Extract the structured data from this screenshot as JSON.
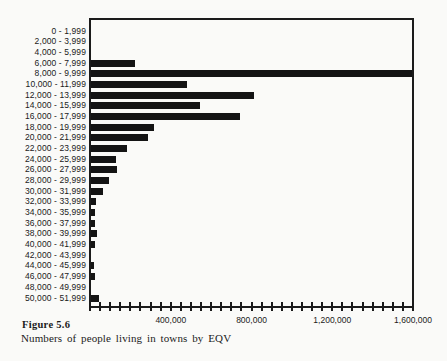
{
  "figure": {
    "label": "Figure 5.6",
    "caption": "Numbers of people living in towns by EQV"
  },
  "chart_data": {
    "type": "bar",
    "orientation": "horizontal",
    "title": "",
    "xlabel": "",
    "ylabel": "",
    "categories": [
      "0 - 1,999",
      "2,000 - 3,999",
      "4,000 - 5,999",
      "6,000 - 7,999",
      "8,000 - 9,999",
      "10,000 - 11,999",
      "12,000 - 13,999",
      "14,000 - 15,999",
      "16,000 - 17,999",
      "18,000 - 19,999",
      "20,000 - 21,999",
      "22,000 - 23,999",
      "24,000 - 25,999",
      "26,000 - 27,999",
      "28,000 - 29,999",
      "30,000 - 31,999",
      "32,000 - 33,999",
      "34,000 - 35,999",
      "36,000 - 37,999",
      "38,000 - 39,999",
      "40,000 - 41,999",
      "42,000 - 43,999",
      "44,000 - 45,999",
      "46,000 - 47,999",
      "48,000 - 49,999",
      "50,000 - 51,999"
    ],
    "values": [
      0,
      0,
      0,
      220000,
      1600000,
      480000,
      810000,
      545000,
      745000,
      315000,
      285000,
      180000,
      125000,
      130000,
      90000,
      60000,
      25000,
      20000,
      20000,
      30000,
      20000,
      0,
      15000,
      20000,
      0,
      40000
    ],
    "xlim": [
      0,
      1600000
    ],
    "x_tick_values": [
      400000,
      800000,
      1200000,
      1600000
    ],
    "x_tick_labels": [
      "400,000",
      "800,000",
      "1,200,000",
      "1,600,000"
    ],
    "minor_tick_interval": 50000,
    "grid": false,
    "legend": "none"
  },
  "colors": {
    "bar": "#141414",
    "axis": "#1b1b1b",
    "text": "#1b1b1b",
    "background": "#fafaf8"
  }
}
